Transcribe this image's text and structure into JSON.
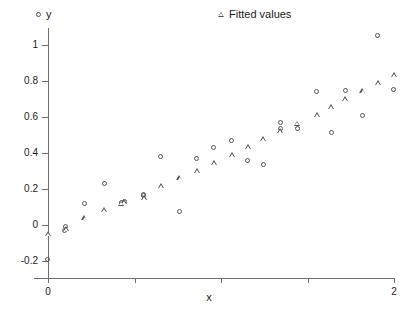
{
  "figure": {
    "background": "#ffffff",
    "marker_color": "#555555",
    "axis_color": "#6e6e6e",
    "width": 418,
    "height": 313
  },
  "legend": {
    "position": "top",
    "entries": [
      {
        "label": "y",
        "marker": "circle-marker-icon"
      },
      {
        "label": "Fitted values",
        "marker": "triangle-marker-icon"
      }
    ]
  },
  "axes": {
    "x": {
      "label": "x",
      "min": -0.08,
      "max": 2.12,
      "ticks": [
        0,
        0.5,
        1,
        1.5,
        2
      ],
      "tick_labels": [
        "0",
        "",
        "",
        "",
        "2"
      ]
    },
    "y": {
      "label": "y",
      "min": -0.28,
      "max": 1.1,
      "ticks": [
        -0.2,
        0,
        0.2,
        0.4,
        0.6,
        0.8,
        1
      ],
      "tick_labels": [
        "-0.2",
        "0",
        "0.2",
        "0.4",
        "0.6",
        "0.8",
        "1"
      ]
    }
  },
  "chart_data": {
    "type": "scatter",
    "title": "",
    "subtitle": "",
    "xlabel": "x",
    "ylabel": "y",
    "xlim": [
      -0.08,
      2.12
    ],
    "ylim": [
      -0.28,
      1.1
    ],
    "grid": false,
    "legend_position": "top",
    "x": [
      0.0,
      0.07,
      0.14,
      0.21,
      0.28,
      0.34,
      0.41,
      0.48,
      0.55,
      0.62,
      0.69,
      0.76,
      0.83,
      0.9,
      0.97,
      1.03,
      1.1,
      1.17,
      1.24,
      1.31,
      1.38,
      1.45,
      1.52,
      1.59,
      1.66,
      1.72,
      1.79,
      1.86,
      1.93,
      2.0
    ],
    "series": [
      {
        "name": "y",
        "marker": "circle",
        "values": [
          -0.195,
          -0.035,
          -0.01,
          0.115,
          0.228,
          0.12,
          0.125,
          0.16,
          0.168,
          0.378,
          0.07,
          0.368,
          0.428,
          0.467,
          0.357,
          0.332,
          0.567,
          0.535,
          0.737,
          0.513,
          0.745,
          0.608,
          1.048,
          0.752,
          null,
          null,
          null,
          null,
          null,
          null
        ]
      },
      {
        "name": "Fitted values",
        "marker": "triangle",
        "values": [
          -0.05,
          -0.022,
          0.038,
          0.083,
          0.121,
          0.127,
          0.152,
          0.218,
          0.261,
          0.303,
          0.348,
          0.392,
          0.435,
          0.481,
          0.524,
          0.565,
          0.613,
          0.657,
          0.701,
          0.747,
          0.789,
          0.836,
          null,
          null,
          null,
          null,
          null,
          null,
          null,
          null
        ]
      }
    ],
    "points_y": [
      {
        "x": 0.0,
        "y": -0.195
      },
      {
        "x": 0.12,
        "y": -0.035
      },
      {
        "x": 0.13,
        "y": -0.01
      },
      {
        "x": 0.26,
        "y": 0.115
      },
      {
        "x": 0.4,
        "y": 0.228
      },
      {
        "x": 0.52,
        "y": 0.12
      },
      {
        "x": 0.54,
        "y": 0.127
      },
      {
        "x": 0.68,
        "y": 0.16
      },
      {
        "x": 0.68,
        "y": 0.168
      },
      {
        "x": 0.8,
        "y": 0.378
      },
      {
        "x": 0.93,
        "y": 0.07
      },
      {
        "x": 1.05,
        "y": 0.368
      },
      {
        "x": 1.17,
        "y": 0.428
      },
      {
        "x": 1.3,
        "y": 0.467
      },
      {
        "x": 1.41,
        "y": 0.357
      },
      {
        "x": 1.52,
        "y": 0.332
      },
      {
        "x": 1.64,
        "y": 0.567
      },
      {
        "x": 1.64,
        "y": 0.535
      },
      {
        "x": 1.76,
        "y": 0.535
      },
      {
        "x": 1.9,
        "y": 0.737
      },
      {
        "x": 2.0,
        "y": 0.513
      },
      {
        "x": 2.1,
        "y": 0.745
      },
      {
        "x": 2.22,
        "y": 0.608
      },
      {
        "x": 2.33,
        "y": 1.048
      },
      {
        "x": 2.44,
        "y": 0.752
      }
    ],
    "points_fitted": [
      {
        "x": 0.0,
        "y": -0.05
      },
      {
        "x": 0.13,
        "y": -0.022
      },
      {
        "x": 0.26,
        "y": 0.038
      },
      {
        "x": 0.4,
        "y": 0.083
      },
      {
        "x": 0.52,
        "y": 0.121
      },
      {
        "x": 0.54,
        "y": 0.127
      },
      {
        "x": 0.68,
        "y": 0.152
      },
      {
        "x": 0.8,
        "y": 0.218
      },
      {
        "x": 0.93,
        "y": 0.261
      },
      {
        "x": 1.05,
        "y": 0.303
      },
      {
        "x": 1.17,
        "y": 0.348
      },
      {
        "x": 1.3,
        "y": 0.392
      },
      {
        "x": 1.41,
        "y": 0.435
      },
      {
        "x": 1.52,
        "y": 0.481
      },
      {
        "x": 1.64,
        "y": 0.524
      },
      {
        "x": 1.76,
        "y": 0.565
      },
      {
        "x": 1.9,
        "y": 0.613
      },
      {
        "x": 2.0,
        "y": 0.657
      },
      {
        "x": 2.1,
        "y": 0.701
      },
      {
        "x": 2.22,
        "y": 0.747
      },
      {
        "x": 2.33,
        "y": 0.789
      },
      {
        "x": 2.44,
        "y": 0.836
      }
    ]
  }
}
